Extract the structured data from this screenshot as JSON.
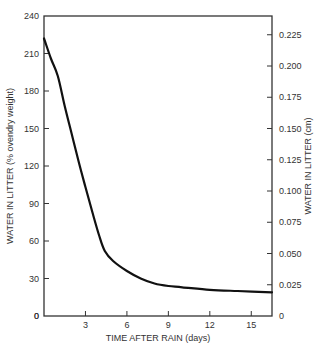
{
  "chart_data": {
    "type": "line",
    "title": "",
    "xlabel": "TIME AFTER RAIN (days)",
    "ylabel": "WATER IN LITTER (% ovendry weight)",
    "y2label": "WATER IN LITTER (cm)",
    "xlim": [
      0,
      16.5
    ],
    "ylim": [
      0,
      240
    ],
    "y2lim": [
      0,
      0.24
    ],
    "grid": false,
    "legend": "none",
    "x_ticks": [
      "3",
      "6",
      "9",
      "12",
      "15"
    ],
    "y_ticks": [
      "0",
      "30",
      "60",
      "90",
      "120",
      "150",
      "180",
      "210",
      "240"
    ],
    "y2_ticks": [
      "0",
      "0.025",
      "0.050",
      "0.075",
      "0.100",
      "0.125",
      "0.150",
      "0.175",
      "0.200",
      "0.225"
    ],
    "series": [
      {
        "name": "Water in litter",
        "x": [
          0,
          0.5,
          1,
          1.5,
          2,
          2.5,
          3,
          3.5,
          4,
          4.4,
          5,
          6,
          7,
          8,
          9,
          10,
          12,
          14,
          16.5
        ],
        "y": [
          222,
          206,
          192,
          168,
          146,
          124,
          103,
          83,
          64,
          52,
          44,
          36,
          30,
          26,
          24,
          23,
          21,
          20,
          19
        ]
      }
    ]
  }
}
